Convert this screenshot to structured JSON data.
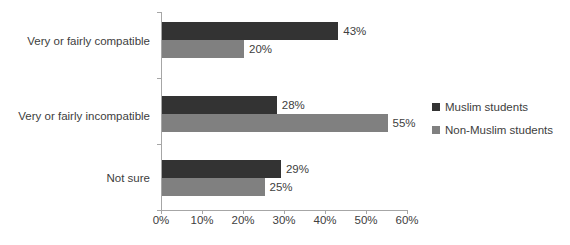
{
  "chart_data": {
    "type": "bar",
    "orientation": "horizontal",
    "title": "",
    "xlabel": "",
    "ylabel": "",
    "xlim": [
      0,
      60
    ],
    "xticks": [
      "0%",
      "10%",
      "20%",
      "30%",
      "40%",
      "50%",
      "60%"
    ],
    "xtick_values": [
      0,
      10,
      20,
      30,
      40,
      50,
      60
    ],
    "grid": false,
    "legend_position": "right",
    "categories": [
      "Very or fairly compatible",
      "Very or fairly incompatible",
      "Not sure"
    ],
    "series": [
      {
        "name": "Muslim students",
        "color": "#333333",
        "values": [
          43,
          28,
          29
        ],
        "labels": [
          "43%",
          "28%",
          "29%"
        ]
      },
      {
        "name": "Non-Muslim students",
        "color": "#808080",
        "values": [
          20,
          55,
          25
        ],
        "labels": [
          "20%",
          "55%",
          "25%"
        ]
      }
    ]
  },
  "axis": {
    "line_color": "#a6a6a6",
    "text_color": "#404040"
  }
}
